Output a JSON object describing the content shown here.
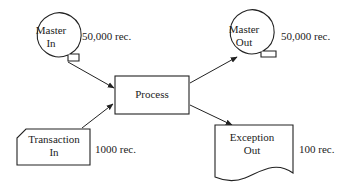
{
  "diagram": {
    "type": "system flowchart",
    "colors": {
      "stroke": "#222222",
      "background": "#ffffff"
    },
    "nodes": [
      {
        "id": "master_in",
        "shape": "magnetic-tape",
        "label_line1": "Master",
        "label_line2": "In",
        "annotation": "50,000 rec."
      },
      {
        "id": "transaction_in",
        "shape": "punched-card",
        "label_line1": "Transaction",
        "label_line2": "In",
        "annotation": "1000 rec."
      },
      {
        "id": "process",
        "shape": "rectangle",
        "label": "Process"
      },
      {
        "id": "master_out",
        "shape": "magnetic-tape",
        "label_line1": "Master",
        "label_line2": "Out",
        "annotation": "50,000 rec."
      },
      {
        "id": "exception_out",
        "shape": "document",
        "label_line1": "Exception",
        "label_line2": "Out",
        "annotation": "100 rec."
      }
    ],
    "edges": [
      {
        "from": "master_in",
        "to": "process"
      },
      {
        "from": "transaction_in",
        "to": "process"
      },
      {
        "from": "process",
        "to": "master_out"
      },
      {
        "from": "process",
        "to": "exception_out"
      }
    ]
  }
}
